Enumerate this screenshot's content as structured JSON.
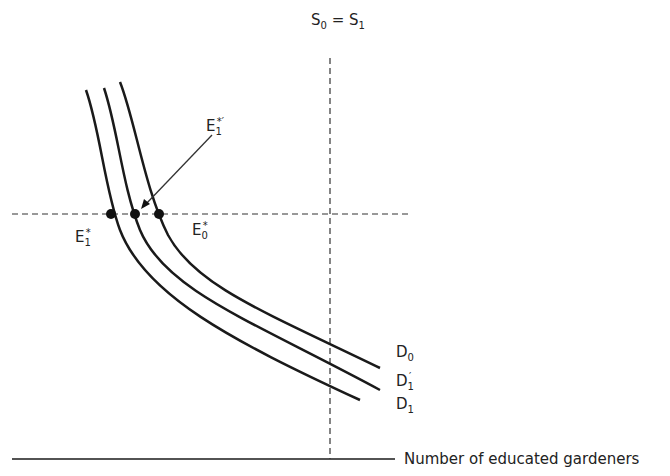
{
  "diagram": {
    "supply_label": {
      "main": "S",
      "sub0": "0",
      "eq": " = ",
      "main2": "S",
      "sub1": "1"
    },
    "x_axis_label": "Number of educated gardeners",
    "curves": [
      {
        "name": "D",
        "sub": "0",
        "prime": ""
      },
      {
        "name": "D",
        "sub": "1",
        "prime": "′"
      },
      {
        "name": "D",
        "sub": "1",
        "prime": ""
      }
    ],
    "equilibria": [
      {
        "name": "E",
        "sub": "1",
        "sup": "*"
      },
      {
        "name": "E",
        "sub": "1",
        "sup": "*′"
      },
      {
        "name": "E",
        "sub": "0",
        "sup": "*"
      }
    ],
    "colors": {
      "line": "#1a1a1a",
      "dash": "#333333"
    }
  }
}
